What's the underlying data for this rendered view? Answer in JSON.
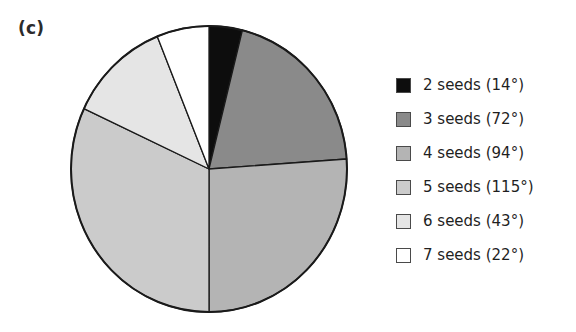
{
  "figure": {
    "panel_label": "(c)"
  },
  "chart_data": {
    "type": "pie",
    "title": "",
    "xlabel": "",
    "ylabel": "",
    "units": "degrees",
    "total_degrees": 360,
    "start_angle_deg": 0,
    "direction": "clockwise",
    "grid": false,
    "legend_position": "right",
    "categories": [
      "2 seeds",
      "3 seeds",
      "4 seeds",
      "5 seeds",
      "6 seeds",
      "7 seeds"
    ],
    "values": [
      14,
      72,
      94,
      115,
      43,
      22
    ],
    "labels": [
      "2 seeds (14°)",
      "3 seeds (72°)",
      "4 seeds (94°)",
      "5 seeds (115°)",
      "6 seeds (43°)",
      "7 seeds (22°)"
    ],
    "colors": [
      "#0d0d0d",
      "#8a8a8a",
      "#b4b4b4",
      "#cbcbcb",
      "#e5e5e5",
      "#ffffff"
    ],
    "slice_outline_color": "#1a1a1a",
    "slices": [
      {
        "name": "2 seeds",
        "degrees": 14,
        "label": "2 seeds (14°)",
        "color": "#0d0d0d",
        "start_deg": 0,
        "end_deg": 14
      },
      {
        "name": "3 seeds",
        "degrees": 72,
        "label": "3 seeds (72°)",
        "color": "#8a8a8a",
        "start_deg": 14,
        "end_deg": 86
      },
      {
        "name": "4 seeds",
        "degrees": 94,
        "label": "4 seeds (94°)",
        "color": "#b4b4b4",
        "start_deg": 86,
        "end_deg": 180
      },
      {
        "name": "5 seeds",
        "degrees": 115,
        "label": "5 seeds (115°)",
        "color": "#cbcbcb",
        "start_deg": 180,
        "end_deg": 295
      },
      {
        "name": "6 seeds",
        "degrees": 43,
        "label": "6 seeds (43°)",
        "color": "#e5e5e5",
        "start_deg": 295,
        "end_deg": 338
      },
      {
        "name": "7 seeds",
        "degrees": 22,
        "label": "7 seeds (22°)",
        "color": "#ffffff",
        "start_deg": 338,
        "end_deg": 360
      }
    ]
  },
  "legend": {
    "items": [
      {
        "label": "2 seeds (14°)",
        "color": "#0d0d0d"
      },
      {
        "label": "3 seeds (72°)",
        "color": "#8a8a8a"
      },
      {
        "label": "4 seeds (94°)",
        "color": "#b4b4b4"
      },
      {
        "label": "5 seeds (115°)",
        "color": "#cbcbcb"
      },
      {
        "label": "6 seeds (43°)",
        "color": "#e5e5e5"
      },
      {
        "label": "7 seeds (22°)",
        "color": "#ffffff"
      }
    ]
  }
}
